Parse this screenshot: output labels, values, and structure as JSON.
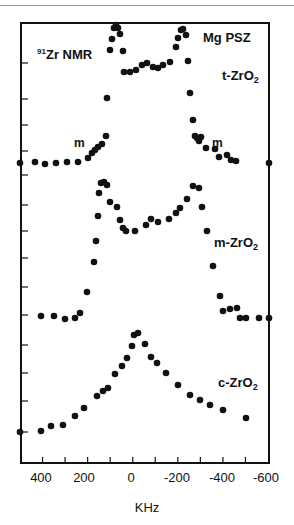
{
  "chart_data": {
    "type": "scatter",
    "subtitle": "Mg PSZ",
    "xlabel": "KHz",
    "ylabel": "",
    "xlim": [
      500,
      -600
    ],
    "x_ticks": [
      400,
      200,
      0,
      -200,
      -400,
      -600
    ],
    "x_minor_ticks": [
      400,
      300,
      200,
      100,
      0,
      -100,
      -200,
      -300,
      -400,
      -500
    ],
    "grid": false,
    "legend": null,
    "annotations": [
      {
        "text": "91Zr NMR",
        "x": 390,
        "note": "title label upper-left"
      },
      {
        "text": "Mg PSZ",
        "x": -310,
        "note": "upper-right"
      },
      {
        "text": "t-ZrO2",
        "series": "t-ZrO2"
      },
      {
        "text": "m",
        "x": 255,
        "series": "t-ZrO2"
      },
      {
        "text": "m",
        "x": -270,
        "series": "t-ZrO2"
      },
      {
        "text": "m-ZrO2",
        "series": "m-ZrO2"
      },
      {
        "text": "c-ZrO2",
        "series": "c-ZrO2"
      }
    ],
    "series": [
      {
        "name": "t-ZrO2",
        "baseline_px": 163,
        "points_px": [
          [
            20,
            163
          ],
          [
            35,
            162
          ],
          [
            45,
            164
          ],
          [
            56,
            163
          ],
          [
            67,
            162
          ],
          [
            78,
            162
          ],
          [
            88,
            158
          ],
          [
            92,
            153
          ],
          [
            95,
            150
          ],
          [
            98,
            147
          ],
          [
            102,
            144
          ],
          [
            106,
            136
          ],
          [
            107,
            98
          ],
          [
            110,
            50
          ],
          [
            112,
            39
          ],
          [
            114,
            28
          ],
          [
            116,
            25
          ],
          [
            118,
            28
          ],
          [
            120,
            34
          ],
          [
            123,
            51
          ],
          [
            124,
            72
          ],
          [
            130,
            72
          ],
          [
            136,
            70
          ],
          [
            142,
            65
          ],
          [
            147,
            63
          ],
          [
            153,
            67
          ],
          [
            158,
            68
          ],
          [
            163,
            65
          ],
          [
            170,
            62
          ],
          [
            176,
            47
          ],
          [
            178,
            38
          ],
          [
            181,
            30
          ],
          [
            183,
            29
          ],
          [
            186,
            35
          ],
          [
            188,
            61
          ],
          [
            190,
            93
          ],
          [
            193,
            120
          ],
          [
            195,
            136
          ],
          [
            197,
            138
          ],
          [
            199,
            141
          ],
          [
            201,
            137
          ],
          [
            206,
            148
          ],
          [
            215,
            149
          ],
          [
            219,
            157
          ],
          [
            227,
            155
          ],
          [
            231,
            160
          ],
          [
            236,
            161
          ],
          [
            269,
            163
          ]
        ]
      },
      {
        "name": "m-ZrO2",
        "baseline_px": 316,
        "points_px": [
          [
            41,
            316
          ],
          [
            54,
            316
          ],
          [
            65,
            319
          ],
          [
            75,
            318
          ],
          [
            80,
            313
          ],
          [
            87,
            292
          ],
          [
            94,
            262
          ],
          [
            96,
            241
          ],
          [
            98,
            216
          ],
          [
            99,
            193
          ],
          [
            101,
            183
          ],
          [
            104,
            182
          ],
          [
            107,
            185
          ],
          [
            110,
            202
          ],
          [
            117,
            207
          ],
          [
            120,
            220
          ],
          [
            123,
            228
          ],
          [
            126,
            231
          ],
          [
            135,
            231
          ],
          [
            146,
            225
          ],
          [
            151,
            219
          ],
          [
            158,
            222
          ],
          [
            169,
            219
          ],
          [
            176,
            213
          ],
          [
            180,
            208
          ],
          [
            187,
            199
          ],
          [
            193,
            186
          ],
          [
            199,
            188
          ],
          [
            202,
            207
          ],
          [
            207,
            231
          ],
          [
            213,
            266
          ],
          [
            220,
            296
          ],
          [
            223,
            311
          ],
          [
            230,
            309
          ],
          [
            237,
            308
          ],
          [
            240,
            318
          ],
          [
            246,
            318
          ],
          [
            259,
            318
          ],
          [
            269,
            318
          ]
        ]
      },
      {
        "name": "c-ZrO2",
        "baseline_px": 432,
        "points_px": [
          [
            20,
            432
          ],
          [
            41,
            431
          ],
          [
            51,
            426
          ],
          [
            63,
            425
          ],
          [
            75,
            416
          ],
          [
            84,
            408
          ],
          [
            97,
            396
          ],
          [
            103,
            391
          ],
          [
            108,
            388
          ],
          [
            115,
            374
          ],
          [
            122,
            366
          ],
          [
            127,
            358
          ],
          [
            132,
            346
          ],
          [
            134,
            335
          ],
          [
            138,
            333
          ],
          [
            145,
            344
          ],
          [
            151,
            357
          ],
          [
            157,
            363
          ],
          [
            166,
            373
          ],
          [
            178,
            385
          ],
          [
            190,
            395
          ],
          [
            200,
            400
          ],
          [
            210,
            405
          ],
          [
            223,
            410
          ],
          [
            246,
            418
          ]
        ]
      }
    ]
  },
  "labels": {
    "title_sup": "91",
    "title_main": "Zr NMR",
    "sample": "Mg PSZ",
    "t_series": "t-ZrO",
    "m_series": "m-ZrO",
    "c_series": "c-ZrO",
    "sub2": "2",
    "m_left": "m",
    "m_right": "m",
    "xaxis": "KHz",
    "ticks": {
      "t400": "400",
      "t200": "200",
      "t0": "0",
      "tm200": "-200",
      "tm400": "-400",
      "tm600": "-600"
    }
  },
  "colors": {
    "ink": "#111111",
    "rule": "#9a9a9a"
  }
}
